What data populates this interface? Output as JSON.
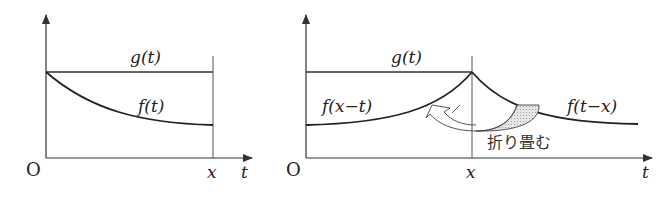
{
  "left_diagram": {
    "origin_label": "O",
    "x_marker_label": "x",
    "t_axis_label": "t",
    "curves": [
      {
        "name": "g",
        "label": "g(t)",
        "shape": "constant"
      },
      {
        "name": "f",
        "label": "f(t)",
        "shape": "decreasing from g(0) toward asymptote"
      }
    ]
  },
  "right_diagram": {
    "origin_label": "O",
    "x_marker_label": "x",
    "t_axis_label": "t",
    "curves": [
      {
        "name": "g",
        "label": "g(t)",
        "shape": "constant on [0, x]"
      },
      {
        "name": "f_reflected",
        "label": "f(x−t)",
        "shape": "increasing to peak at t = x"
      },
      {
        "name": "f_shifted",
        "label": "f(t−x)",
        "shape": "decreasing from peak at t = x"
      }
    ],
    "annotation": "折り畳む",
    "annotation_meaning": "fold"
  },
  "colors": {
    "line": "#333333",
    "fill_shaded": "#d0d0d0"
  }
}
